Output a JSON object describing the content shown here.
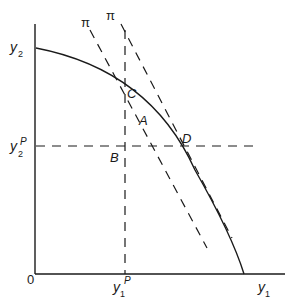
{
  "diagram": {
    "type": "production-possibility-frontier",
    "axes": {
      "origin_label": "0",
      "x_label": "y",
      "x_label_sub": "1",
      "y_label": "y",
      "y_label_sub": "2"
    },
    "reference_lines": {
      "x_level": "y",
      "x_level_sub": "1",
      "x_level_sup": "P",
      "y_level": "y",
      "y_level_sub": "2",
      "y_level_sup": "P"
    },
    "price_lines": [
      {
        "label": "π"
      },
      {
        "label": "π"
      }
    ],
    "points": {
      "A": "A",
      "B": "B",
      "C": "C",
      "D": "D"
    },
    "colors": {
      "line": "#1a1a1a",
      "background": "#ffffff"
    }
  }
}
